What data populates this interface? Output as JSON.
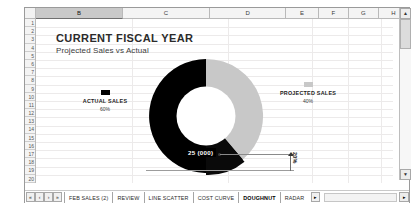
{
  "spreadsheet": {
    "columns": [
      {
        "label": "B",
        "selected": true,
        "width": 96
      },
      {
        "label": "C",
        "selected": false,
        "width": 96
      },
      {
        "label": "D",
        "selected": false,
        "width": 84
      },
      {
        "label": "E",
        "selected": false,
        "width": 36
      },
      {
        "label": "F",
        "selected": false,
        "width": 33
      },
      {
        "label": "G",
        "selected": false,
        "width": 33
      },
      {
        "label": "H",
        "selected": false,
        "width": 33
      }
    ],
    "rows": [
      "1",
      "2",
      "3",
      "4",
      "5",
      "6",
      "7",
      "8",
      "9",
      "10",
      "11",
      "12",
      "13",
      "14",
      "15",
      "16",
      "17",
      "18",
      "19",
      "20"
    ],
    "sheet_tabs": [
      {
        "label": "FEB SALES (2)",
        "active": false
      },
      {
        "label": "REVIEW",
        "active": false
      },
      {
        "label": "LINE SCATTER",
        "active": false
      },
      {
        "label": "COST CURVE",
        "active": false
      },
      {
        "label": "DOUGHNUT",
        "active": true
      },
      {
        "label": "RADAR",
        "active": false
      }
    ],
    "nav_buttons": [
      "«",
      "‹",
      "›",
      "»"
    ],
    "tab_scroll_end": "▸",
    "scrollbar": {
      "up_arrow": "▲",
      "down_arrow": "▼",
      "left_arrow": "◂",
      "right_arrow": "▸"
    }
  },
  "chart_data": {
    "type": "pie",
    "title": "CURRENT FISCAL YEAR",
    "subtitle": "Projected Sales vs Actual",
    "categories": [
      "ACTUAL SALES",
      "PROJECTED SALES"
    ],
    "values": [
      60,
      40
    ],
    "value_labels": [
      "60%",
      "40%"
    ],
    "colors": [
      "#000000",
      "#c8c8c8"
    ],
    "legend_position": "outside-left-and-right",
    "annotations": [
      {
        "name": "callout",
        "text": "25 (000)"
      },
      {
        "name": "gap-measure",
        "text": "20%"
      }
    ],
    "donut_hole_ratio": 0.52,
    "grid": false,
    "xlabel": "",
    "ylabel": ""
  },
  "chart": {
    "title": "CURRENT FISCAL YEAR",
    "subtitle": "Projected Sales vs Actual",
    "series_left": {
      "label": "ACTUAL SALES",
      "percent": "60%",
      "color": "#000000"
    },
    "series_right": {
      "label": "PROJECTED SALES",
      "percent": "40%",
      "color": "#c8c8c8"
    },
    "callout_value": "25 (000)",
    "measure_value": "20%"
  }
}
